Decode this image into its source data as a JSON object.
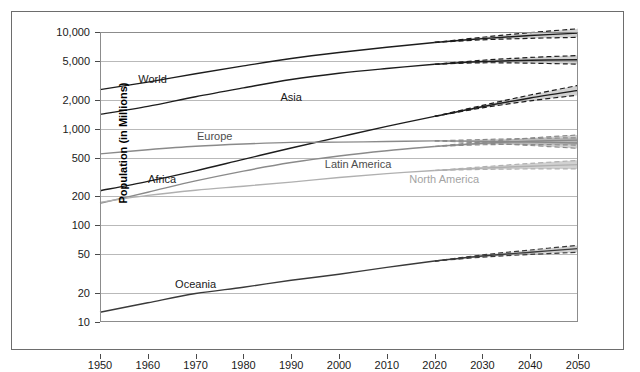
{
  "chart_data": {
    "type": "line",
    "title": "",
    "xlabel": "",
    "ylabel": "Population (in Millions)",
    "xlim": [
      1950,
      2050
    ],
    "ylim": [
      10,
      10000
    ],
    "yscale": "log",
    "grid": true,
    "legend": "inline-labels",
    "x_ticks": [
      1950,
      1960,
      1970,
      1980,
      1990,
      2000,
      2010,
      2020,
      2030,
      2040,
      2050
    ],
    "x_tick_labels": [
      "1950",
      "1960",
      "1970",
      "1980",
      "1990",
      "2000",
      "2010",
      "2020",
      "2030",
      "2040",
      "2050"
    ],
    "y_ticks": [
      10,
      20,
      50,
      100,
      200,
      500,
      1000,
      2000,
      5000,
      10000
    ],
    "y_tick_labels": [
      "10",
      "20",
      "50",
      "100",
      "200",
      "500",
      "1,000",
      "2,000",
      "5,000",
      "10,000"
    ],
    "projection_start_year": 2020,
    "annotations": [
      "Solid lines are estimates to 2020; dashed lines are high/low projection variants to 2050; shaded bands show the projection uncertainty interval."
    ],
    "x": [
      1950,
      1960,
      1970,
      1980,
      1990,
      2000,
      2010,
      2020,
      2030,
      2040,
      2050
    ],
    "series": [
      {
        "name": "World",
        "color": "#1d1d1d",
        "label_color": "#1a1a1a",
        "label_x": 1961,
        "label_y": 3300,
        "values": [
          2536,
          3034,
          3700,
          4458,
          5327,
          6143,
          6957,
          7795,
          8548,
          9199,
          9735
        ],
        "high": [
          2536,
          3034,
          3700,
          4458,
          5327,
          6143,
          6957,
          7795,
          8820,
          9850,
          10800
        ],
        "low": [
          2536,
          3034,
          3700,
          4458,
          5327,
          6143,
          6957,
          7795,
          8300,
          8600,
          8800
        ]
      },
      {
        "name": "Asia",
        "color": "#1d1d1d",
        "label_color": "#1a1a1a",
        "label_x": 1990,
        "label_y": 2150,
        "values": [
          1404,
          1700,
          2142,
          2642,
          3226,
          3741,
          4194,
          4641,
          4947,
          5100,
          5166
        ],
        "high": [
          1404,
          1700,
          2142,
          2642,
          3226,
          3741,
          4194,
          4641,
          5100,
          5450,
          5700
        ],
        "low": [
          1404,
          1700,
          2142,
          2642,
          3226,
          3741,
          4194,
          4641,
          4800,
          4760,
          4650
        ]
      },
      {
        "name": "Africa",
        "color": "#1d1d1d",
        "label_color": "#1a1a1a",
        "label_x": 1963,
        "label_y": 300,
        "values": [
          228,
          285,
          366,
          481,
          631,
          818,
          1055,
          1341,
          1688,
          2077,
          2489
        ],
        "high": [
          228,
          285,
          366,
          481,
          631,
          818,
          1055,
          1341,
          1740,
          2230,
          2800
        ],
        "low": [
          228,
          285,
          366,
          481,
          631,
          818,
          1055,
          1341,
          1640,
          1940,
          2220
        ]
      },
      {
        "name": "Europe",
        "color": "#8a8a8a",
        "label_color": "#4d4d4d",
        "label_x": 1974,
        "label_y": 830,
        "values": [
          549,
          605,
          657,
          694,
          721,
          726,
          736,
          748,
          741,
          728,
          710
        ],
        "high": [
          549,
          605,
          657,
          694,
          721,
          726,
          736,
          748,
          772,
          792,
          805
        ],
        "low": [
          549,
          605,
          657,
          694,
          721,
          726,
          736,
          748,
          712,
          670,
          625
        ]
      },
      {
        "name": "Latin America",
        "color": "#8a8a8a",
        "label_color": "#4d4d4d",
        "label_x": 2004,
        "label_y": 430,
        "values": [
          169,
          220,
          288,
          364,
          446,
          522,
          591,
          654,
          706,
          740,
          762
        ],
        "high": [
          169,
          220,
          288,
          364,
          446,
          522,
          591,
          654,
          730,
          800,
          860
        ],
        "low": [
          169,
          220,
          288,
          364,
          446,
          522,
          591,
          654,
          682,
          686,
          676
        ]
      },
      {
        "name": "North America",
        "color": "#b0b0b0",
        "label_color": "#a3a3a3",
        "label_x": 2022,
        "label_y": 300,
        "values": [
          173,
          204,
          231,
          254,
          280,
          313,
          343,
          369,
          391,
          409,
          425
        ],
        "high": [
          173,
          204,
          231,
          254,
          280,
          313,
          343,
          369,
          403,
          437,
          470
        ],
        "low": [
          173,
          204,
          231,
          254,
          280,
          313,
          343,
          369,
          379,
          383,
          383
        ]
      },
      {
        "name": "Oceania",
        "color": "#3a3a3a",
        "label_color": "#1a1a1a",
        "label_x": 1970,
        "label_y": 25,
        "values": [
          12.6,
          15.8,
          19.7,
          22.9,
          27.0,
          31.2,
          36.7,
          42.7,
          48.1,
          52.7,
          57.4
        ],
        "high": [
          12.6,
          15.8,
          19.7,
          22.9,
          27.0,
          31.2,
          36.7,
          42.7,
          49.4,
          55.6,
          62.0
        ],
        "low": [
          12.6,
          15.8,
          19.7,
          22.9,
          27.0,
          31.2,
          36.7,
          42.7,
          46.8,
          50.0,
          52.6
        ]
      }
    ]
  }
}
